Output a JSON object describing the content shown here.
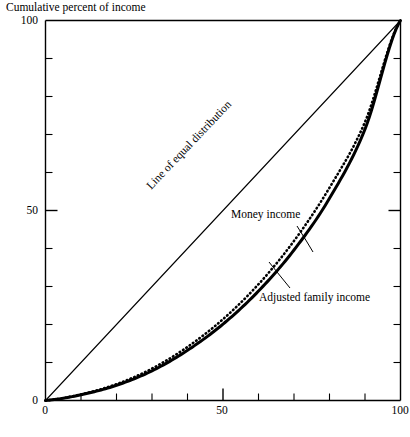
{
  "chart_data": {
    "type": "line",
    "title": "",
    "ylabel": "Cumulative percent of income",
    "xlabel": "Cumulative percent of families",
    "xlim": [
      0,
      100
    ],
    "ylim": [
      0,
      100
    ],
    "grid": false,
    "legend_position": "inline-annotations",
    "x_tick_labels": [
      "0",
      "50",
      "100"
    ],
    "x_tick_values": [
      0,
      50,
      100
    ],
    "y_tick_labels": [
      "0",
      "50",
      "100"
    ],
    "y_tick_values": [
      0,
      50,
      100
    ],
    "minor_tick_interval": 10,
    "annotations": [
      "Line of equal distribution",
      "Money income",
      "Adjusted family income"
    ],
    "x": [
      0,
      10,
      20,
      30,
      40,
      50,
      60,
      70,
      80,
      90,
      100
    ],
    "series": [
      {
        "name": "Line of equal distribution",
        "style": "thin-solid",
        "values": [
          0,
          10,
          20,
          30,
          40,
          50,
          60,
          70,
          80,
          90,
          100
        ]
      },
      {
        "name": "Money income",
        "style": "dotted",
        "values": [
          0,
          1.6,
          4.3,
          8.4,
          14.1,
          21.4,
          30.6,
          42.0,
          56.0,
          73.3,
          100
        ]
      },
      {
        "name": "Adjusted family income",
        "style": "thick-solid",
        "values": [
          0,
          1.5,
          4.0,
          7.8,
          13.2,
          20.1,
          28.8,
          39.6,
          53.2,
          71.4,
          100
        ]
      }
    ]
  },
  "labels": {
    "y_axis_title": "Cumulative percent of income",
    "x_axis_title": "Cumulative percent of families",
    "y_tick_0": "0",
    "y_tick_50": "50",
    "y_tick_100": "100",
    "x_tick_0": "0",
    "x_tick_50": "50",
    "x_tick_100": "100",
    "line_equal": "Line of equal distribution",
    "money_income": "Money income",
    "adjusted_family_income": "Adjusted family income"
  },
  "colors": {
    "ink": "#000000",
    "background": "#ffffff"
  }
}
